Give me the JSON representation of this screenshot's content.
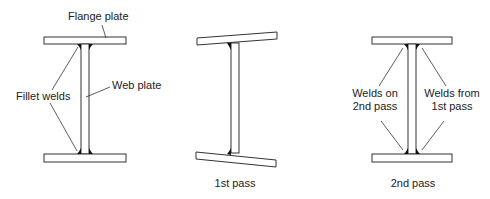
{
  "figures": [
    {
      "id": "setup",
      "labels": {
        "flange": "Flange plate",
        "web": "Web plate",
        "welds": "Fillet welds"
      }
    },
    {
      "id": "first-pass",
      "caption": "1st pass"
    },
    {
      "id": "second-pass",
      "caption": "2nd pass",
      "labels": {
        "left_line1": "Welds on",
        "left_line2": "2nd pass",
        "right_line1": "Welds from",
        "right_line2": "1st pass"
      }
    }
  ],
  "colors": {
    "line": "#333333",
    "weld": "#111111",
    "background": "#ffffff"
  }
}
